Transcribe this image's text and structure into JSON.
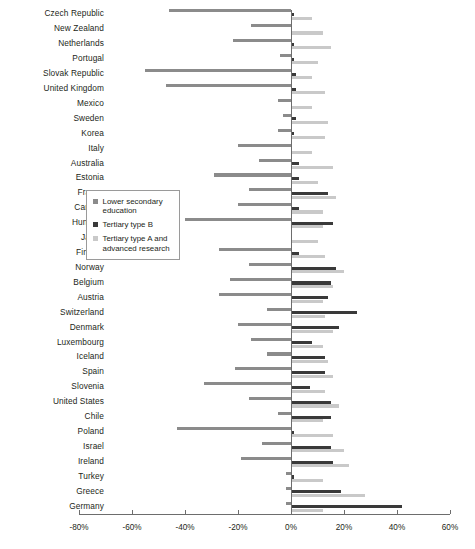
{
  "chart_data": {
    "type": "bar",
    "orientation": "horizontal",
    "title": "",
    "subtitle": "",
    "xlabel": "",
    "ylabel": "",
    "xlim": [
      -80,
      60
    ],
    "xticks": [
      -80,
      -60,
      -40,
      -20,
      0,
      20,
      40,
      60
    ],
    "xtick_labels": [
      "-80%",
      "-60%",
      "-40%",
      "-20%",
      "0%",
      "20%",
      "40%",
      "60%"
    ],
    "grid": false,
    "legend_position": "center-left",
    "value_unit": "%",
    "categories": [
      "Czech Republic",
      "New Zealand",
      "Netherlands",
      "Portugal",
      "Slovak Republic",
      "United Kingdom",
      "Mexico",
      "Sweden",
      "Korea",
      "Italy",
      "Australia",
      "Estonia",
      "France",
      "Canada",
      "Hungary",
      "Japan",
      "Finland",
      "Norway",
      "Belgium",
      "Austria",
      "Switzerland",
      "Denmark",
      "Luxembourg",
      "Iceland",
      "Spain",
      "Slovenia",
      "United States",
      "Chile",
      "Poland",
      "Israel",
      "Ireland",
      "Turkey",
      "Greece",
      "Germany"
    ],
    "series": [
      {
        "name": "Lower secondary education",
        "color": "#8b8b8b",
        "values": [
          -46,
          -15,
          -22,
          -4,
          -55,
          -47,
          -5,
          -3,
          -5,
          -20,
          -12,
          -29,
          -16,
          -20,
          -40,
          0,
          -27,
          -16,
          -23,
          -27,
          -9,
          -20,
          -15,
          -9,
          -21,
          -33,
          -16,
          -5,
          -43,
          -11,
          -19,
          -2,
          -2,
          -2
        ]
      },
      {
        "name": "Tertiary type B",
        "color": "#3a3a3a",
        "values": [
          1,
          0,
          1,
          1,
          2,
          2,
          0,
          2,
          1,
          0,
          3,
          3,
          14,
          3,
          16,
          0,
          3,
          17,
          15,
          14,
          25,
          18,
          8,
          13,
          13,
          7,
          15,
          15,
          1,
          15,
          16,
          1,
          19,
          42
        ]
      },
      {
        "name": "Tertiary type A and advanced research",
        "color": "#c9c9c9",
        "values": [
          8,
          12,
          15,
          10,
          8,
          13,
          8,
          14,
          13,
          8,
          16,
          10,
          17,
          12,
          12,
          10,
          13,
          20,
          16,
          12,
          13,
          16,
          12,
          14,
          16,
          13,
          18,
          12,
          16,
          20,
          22,
          12,
          28,
          12
        ]
      }
    ]
  },
  "legend": {
    "items": [
      {
        "label": "Lower secondary education",
        "color": "#8b8b8b"
      },
      {
        "label": "Tertiary type B",
        "color": "#3a3a3a"
      },
      {
        "label": "Tertiary type A and advanced research",
        "color": "#c9c9c9"
      }
    ]
  }
}
